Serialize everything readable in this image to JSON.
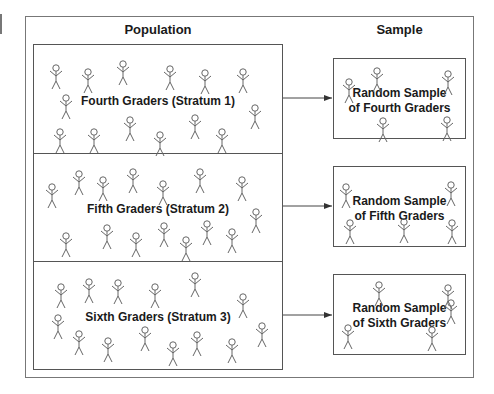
{
  "headings": {
    "population": "Population",
    "sample": "Sample"
  },
  "strata": [
    {
      "label": "Fourth Graders (Stratum 1)",
      "sample_label_line1": "Random Sample",
      "sample_label_line2": "of Fourth Graders"
    },
    {
      "label": "Fifth Graders (Stratum 2)",
      "sample_label_line1": "Random Sample",
      "sample_label_line2": "of Fifth Graders"
    },
    {
      "label": "Sixth Graders (Stratum 3)",
      "sample_label_line1": "Random Sample",
      "sample_label_line2": "of Sixth Graders"
    }
  ],
  "figures": {
    "population": [
      [
        [
          56,
          68
        ],
        [
          88,
          72
        ],
        [
          123,
          64
        ],
        [
          170,
          69
        ],
        [
          205,
          73
        ],
        [
          243,
          72
        ],
        [
          66,
          98
        ],
        [
          255,
          108
        ],
        [
          60,
          132
        ],
        [
          94,
          132
        ],
        [
          130,
          120
        ],
        [
          160,
          135
        ],
        [
          195,
          118
        ],
        [
          222,
          132
        ]
      ],
      [
        [
          52,
          187
        ],
        [
          79,
          174
        ],
        [
          103,
          180
        ],
        [
          133,
          172
        ],
        [
          163,
          184
        ],
        [
          200,
          172
        ],
        [
          242,
          180
        ],
        [
          256,
          212
        ],
        [
          66,
          236
        ],
        [
          107,
          228
        ],
        [
          136,
          236
        ],
        [
          164,
          226
        ],
        [
          186,
          240
        ],
        [
          207,
          224
        ],
        [
          232,
          232
        ]
      ],
      [
        [
          61,
          287
        ],
        [
          89,
          282
        ],
        [
          118,
          283
        ],
        [
          155,
          287
        ],
        [
          195,
          276
        ],
        [
          243,
          297
        ],
        [
          58,
          318
        ],
        [
          79,
          334
        ],
        [
          108,
          341
        ],
        [
          145,
          330
        ],
        [
          173,
          345
        ],
        [
          197,
          335
        ],
        [
          232,
          342
        ],
        [
          262,
          326
        ]
      ]
    ],
    "sample": [
      [
        [
          349,
          82
        ],
        [
          377,
          71
        ],
        [
          448,
          74
        ],
        [
          383,
          121
        ],
        [
          447,
          120
        ]
      ],
      [
        [
          346,
          187
        ],
        [
          451,
          185
        ],
        [
          350,
          223
        ],
        [
          404,
          222
        ],
        [
          452,
          223
        ]
      ],
      [
        [
          379,
          285
        ],
        [
          448,
          288
        ],
        [
          451,
          303
        ],
        [
          348,
          328
        ],
        [
          432,
          330
        ]
      ]
    ]
  },
  "colors": {
    "line": "#555555",
    "figure": "#666666",
    "text": "#1a1a1a"
  }
}
